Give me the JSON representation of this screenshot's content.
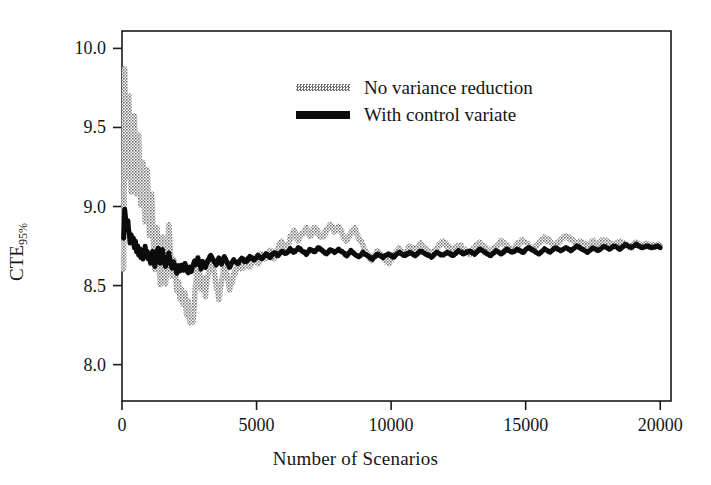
{
  "chart_data": {
    "type": "line",
    "title": "",
    "xlabel": "Number of Scenarios",
    "ylabel": "CTE",
    "ylabel_sub": "95%",
    "xlim": [
      0,
      20400
    ],
    "ylim": [
      7.77,
      10.11
    ],
    "xticks": [
      0,
      5000,
      10000,
      15000,
      20000
    ],
    "xtick_labels": [
      "0",
      "5000",
      "10000",
      "15000",
      "20000"
    ],
    "yticks": [
      8.0,
      8.5,
      9.0,
      9.5,
      10.0
    ],
    "ytick_labels": [
      "8.0",
      "8.5",
      "9.0",
      "9.5",
      "10.0"
    ],
    "grid": false,
    "legend_position": "upper center",
    "frame": true,
    "colors": {
      "no_variance_reduction": "#6f6f6f",
      "with_control_variate": "#0b0b0b",
      "axis": "#1a1a1a",
      "background": "#ffffff"
    },
    "series": [
      {
        "name": "No variance reduction",
        "style": "dotted-thick",
        "color": "#6f6f6f",
        "x": [
          60,
          100,
          140,
          180,
          220,
          260,
          300,
          340,
          380,
          420,
          460,
          500,
          540,
          580,
          620,
          660,
          700,
          740,
          780,
          820,
          860,
          900,
          940,
          980,
          1020,
          1060,
          1100,
          1140,
          1180,
          1220,
          1260,
          1300,
          1340,
          1380,
          1420,
          1460,
          1500,
          1560,
          1620,
          1680,
          1740,
          1800,
          1860,
          1920,
          1980,
          2040,
          2100,
          2160,
          2220,
          2280,
          2340,
          2400,
          2460,
          2520,
          2580,
          2640,
          2700,
          2760,
          2820,
          2880,
          2940,
          3000,
          3100,
          3200,
          3300,
          3400,
          3500,
          3600,
          3700,
          3800,
          3900,
          4000,
          4150,
          4300,
          4450,
          4600,
          4750,
          4900,
          5050,
          5200,
          5350,
          5500,
          5650,
          5800,
          5950,
          6100,
          6250,
          6400,
          6550,
          6700,
          6850,
          7000,
          7150,
          7300,
          7450,
          7600,
          7750,
          7900,
          8050,
          8200,
          8350,
          8500,
          8650,
          8800,
          8950,
          9100,
          9300,
          9500,
          9700,
          9900,
          10100,
          10300,
          10500,
          10700,
          10900,
          11100,
          11300,
          11500,
          11700,
          11900,
          12100,
          12300,
          12500,
          12700,
          12900,
          13100,
          13300,
          13500,
          13700,
          13900,
          14100,
          14300,
          14500,
          14700,
          14900,
          15100,
          15300,
          15500,
          15700,
          15900,
          16100,
          16300,
          16500,
          16700,
          16900,
          17100,
          17300,
          17500,
          17700,
          17900,
          18100,
          18300,
          18500,
          18700,
          18900,
          19100,
          19300,
          19500,
          19700,
          19900,
          20000
        ],
        "y": [
          8.62,
          9.9,
          9.35,
          9.18,
          9.46,
          9.72,
          9.3,
          9.12,
          9.38,
          9.14,
          9.56,
          9.33,
          9.08,
          9.25,
          9.44,
          9.2,
          9.02,
          9.18,
          9.3,
          9.05,
          8.88,
          9.06,
          9.22,
          9.0,
          8.82,
          8.95,
          9.1,
          8.9,
          8.72,
          8.58,
          8.7,
          8.86,
          8.74,
          8.6,
          8.52,
          8.66,
          8.8,
          8.62,
          8.5,
          8.7,
          8.9,
          8.72,
          8.55,
          8.68,
          8.58,
          8.45,
          8.54,
          8.4,
          8.48,
          8.36,
          8.44,
          8.32,
          8.4,
          8.26,
          8.34,
          8.28,
          8.42,
          8.56,
          8.68,
          8.58,
          8.48,
          8.54,
          8.44,
          8.58,
          8.7,
          8.6,
          8.5,
          8.42,
          8.52,
          8.64,
          8.56,
          8.47,
          8.56,
          8.64,
          8.6,
          8.66,
          8.62,
          8.68,
          8.64,
          8.7,
          8.66,
          8.72,
          8.68,
          8.74,
          8.78,
          8.73,
          8.8,
          8.84,
          8.78,
          8.83,
          8.86,
          8.81,
          8.87,
          8.83,
          8.8,
          8.85,
          8.88,
          8.84,
          8.87,
          8.82,
          8.78,
          8.83,
          8.86,
          8.8,
          8.75,
          8.7,
          8.66,
          8.72,
          8.68,
          8.64,
          8.69,
          8.73,
          8.7,
          8.75,
          8.72,
          8.76,
          8.73,
          8.7,
          8.74,
          8.78,
          8.75,
          8.72,
          8.76,
          8.73,
          8.7,
          8.74,
          8.77,
          8.74,
          8.71,
          8.75,
          8.78,
          8.75,
          8.72,
          8.76,
          8.79,
          8.76,
          8.73,
          8.77,
          8.8,
          8.78,
          8.75,
          8.79,
          8.82,
          8.79,
          8.76,
          8.78,
          8.75,
          8.78,
          8.76,
          8.79,
          8.77,
          8.75,
          8.78,
          8.76,
          8.74,
          8.77,
          8.75,
          8.76,
          8.75,
          8.76,
          8.75
        ]
      },
      {
        "name": "With control variate",
        "style": "solid-thick",
        "color": "#0b0b0b",
        "x": [
          60,
          100,
          140,
          180,
          220,
          260,
          300,
          340,
          380,
          420,
          460,
          500,
          540,
          580,
          620,
          660,
          700,
          740,
          780,
          820,
          860,
          900,
          940,
          980,
          1020,
          1060,
          1100,
          1140,
          1180,
          1220,
          1260,
          1300,
          1340,
          1380,
          1420,
          1460,
          1500,
          1560,
          1620,
          1680,
          1740,
          1800,
          1860,
          1920,
          1980,
          2040,
          2100,
          2160,
          2220,
          2280,
          2340,
          2400,
          2460,
          2520,
          2580,
          2640,
          2700,
          2760,
          2820,
          2880,
          2940,
          3000,
          3100,
          3200,
          3300,
          3400,
          3500,
          3600,
          3700,
          3800,
          3900,
          4000,
          4150,
          4300,
          4450,
          4600,
          4750,
          4900,
          5050,
          5200,
          5350,
          5500,
          5650,
          5800,
          5950,
          6100,
          6250,
          6400,
          6550,
          6700,
          6850,
          7000,
          7150,
          7300,
          7450,
          7600,
          7750,
          7900,
          8050,
          8200,
          8350,
          8500,
          8650,
          8800,
          8950,
          9100,
          9300,
          9500,
          9700,
          9900,
          10100,
          10300,
          10500,
          10700,
          10900,
          11100,
          11300,
          11500,
          11700,
          11900,
          12100,
          12300,
          12500,
          12700,
          12900,
          13100,
          13300,
          13500,
          13700,
          13900,
          14100,
          14300,
          14500,
          14700,
          14900,
          15100,
          15300,
          15500,
          15700,
          15900,
          16100,
          16300,
          16500,
          16700,
          16900,
          17100,
          17300,
          17500,
          17700,
          17900,
          18100,
          18300,
          18500,
          18700,
          18900,
          19100,
          19300,
          19500,
          19700,
          19900,
          20000
        ],
        "y": [
          8.8,
          8.98,
          8.92,
          8.86,
          8.9,
          8.84,
          8.78,
          8.82,
          8.76,
          8.8,
          8.74,
          8.78,
          8.72,
          8.76,
          8.7,
          8.74,
          8.68,
          8.72,
          8.66,
          8.7,
          8.74,
          8.68,
          8.72,
          8.66,
          8.7,
          8.64,
          8.68,
          8.72,
          8.66,
          8.62,
          8.66,
          8.7,
          8.74,
          8.68,
          8.64,
          8.68,
          8.72,
          8.66,
          8.62,
          8.66,
          8.7,
          8.65,
          8.61,
          8.65,
          8.62,
          8.58,
          8.62,
          8.59,
          8.63,
          8.6,
          8.64,
          8.61,
          8.58,
          8.62,
          8.59,
          8.63,
          8.66,
          8.63,
          8.67,
          8.64,
          8.61,
          8.65,
          8.62,
          8.66,
          8.69,
          8.66,
          8.63,
          8.67,
          8.64,
          8.68,
          8.65,
          8.62,
          8.66,
          8.64,
          8.67,
          8.65,
          8.68,
          8.66,
          8.69,
          8.67,
          8.7,
          8.68,
          8.71,
          8.69,
          8.72,
          8.7,
          8.73,
          8.71,
          8.74,
          8.72,
          8.7,
          8.73,
          8.71,
          8.74,
          8.72,
          8.7,
          8.73,
          8.71,
          8.73,
          8.71,
          8.69,
          8.72,
          8.7,
          8.68,
          8.71,
          8.69,
          8.67,
          8.7,
          8.68,
          8.7,
          8.68,
          8.71,
          8.69,
          8.71,
          8.69,
          8.72,
          8.7,
          8.68,
          8.71,
          8.69,
          8.71,
          8.69,
          8.72,
          8.7,
          8.72,
          8.7,
          8.73,
          8.71,
          8.69,
          8.72,
          8.7,
          8.73,
          8.71,
          8.73,
          8.71,
          8.74,
          8.72,
          8.7,
          8.73,
          8.71,
          8.74,
          8.72,
          8.74,
          8.72,
          8.75,
          8.73,
          8.71,
          8.74,
          8.72,
          8.75,
          8.73,
          8.75,
          8.73,
          8.76,
          8.74,
          8.76,
          8.74,
          8.75,
          8.74,
          8.75,
          8.74
        ]
      }
    ]
  },
  "legend": {
    "items": [
      {
        "label": "No variance reduction",
        "swatch": "gray-dotted-line"
      },
      {
        "label": "With control variate",
        "swatch": "black-solid-line"
      }
    ]
  }
}
